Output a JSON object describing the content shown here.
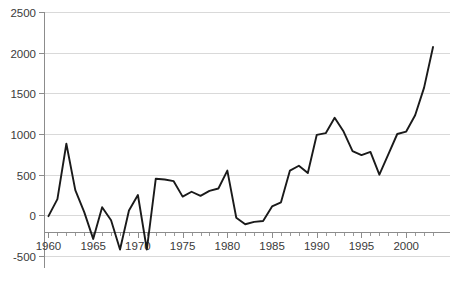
{
  "chart_data": {
    "type": "line",
    "title": "",
    "subtitle": "",
    "xlabel": "",
    "ylabel": "",
    "xlim": [
      1959.5,
      2003.5
    ],
    "ylim": [
      -500,
      2500
    ],
    "grid": true,
    "legend": false,
    "legend_position": "none",
    "line_color": "#1a1a1a",
    "grid_color": "#d9d9d9",
    "axis_color": "#8c8c8c",
    "background_color": "#ffffff",
    "y_ticks": [
      2500,
      2000,
      1500,
      1000,
      500,
      0,
      -500
    ],
    "y_tick_labels": [
      "2500",
      "2000",
      "1500",
      "1000",
      "500",
      "0",
      "-500"
    ],
    "x_ticks": [
      1960,
      1965,
      1970,
      1975,
      1980,
      1985,
      1990,
      1995,
      2000
    ],
    "x_tick_labels": [
      "1960",
      "1965",
      "1970",
      "1975",
      "1980",
      "1985",
      "1990",
      "1995",
      "2000"
    ],
    "x_minor_tick_step": 1,
    "x": [
      1960,
      1961,
      1962,
      1963,
      1964,
      1965,
      1966,
      1967,
      1968,
      1969,
      1970,
      1971,
      1972,
      1973,
      1974,
      1975,
      1976,
      1977,
      1978,
      1979,
      1980,
      1981,
      1982,
      1983,
      1984,
      1985,
      1986,
      1987,
      1988,
      1989,
      1990,
      1991,
      1992,
      1993,
      1994,
      1995,
      1996,
      1997,
      1998,
      1999,
      2000,
      2001,
      2002,
      2003
    ],
    "values": [
      -10,
      200,
      880,
      310,
      40,
      -290,
      100,
      -60,
      -420,
      60,
      250,
      -420,
      450,
      440,
      420,
      230,
      290,
      240,
      300,
      330,
      550,
      -30,
      -110,
      -80,
      -70,
      110,
      160,
      550,
      610,
      520,
      990,
      1010,
      1200,
      1030,
      790,
      740,
      780,
      500,
      750,
      1000,
      1030,
      1230,
      1570,
      2070
    ],
    "series": [
      {
        "name": "series-1",
        "values": [
          -10,
          200,
          880,
          310,
          40,
          -290,
          100,
          -60,
          -420,
          60,
          250,
          -420,
          450,
          440,
          420,
          230,
          290,
          240,
          300,
          330,
          550,
          -30,
          -110,
          -80,
          -70,
          110,
          160,
          550,
          610,
          520,
          990,
          1010,
          1200,
          1030,
          790,
          740,
          780,
          500,
          750,
          1000,
          1030,
          1230,
          1570,
          2070
        ]
      }
    ],
    "annotations": []
  }
}
